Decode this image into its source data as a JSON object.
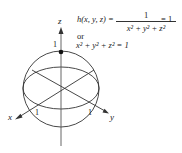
{
  "equation": {
    "lhs": "h(x, y, z) =",
    "numerator": "1",
    "denominator": "x² + y² + z²",
    "rhs": "= 1",
    "connector": "or",
    "alt": "x² + y² + z² = 1"
  },
  "axes": {
    "x_label": "x",
    "y_label": "y",
    "z_label": "z",
    "x_tick": "1",
    "y_tick": "1",
    "z_tick": "1"
  },
  "colors": {
    "stroke": "#333333",
    "background": "#ffffff"
  }
}
